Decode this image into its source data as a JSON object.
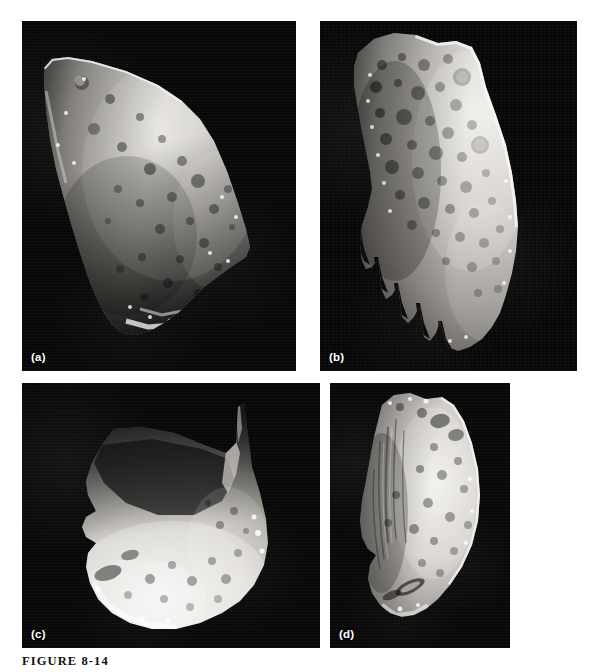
{
  "figure": {
    "caption": "FIGURE 8-14",
    "background_color": "#ffffff",
    "sky_color": "#070707",
    "label_color": "#ffffff"
  },
  "panels": [
    {
      "id": "panel-a",
      "label": "(a)",
      "subject": "cratered-elongated-asteroid",
      "x": 22,
      "y": 21,
      "width": 274,
      "height": 350
    },
    {
      "id": "panel-b",
      "label": "(b)",
      "subject": "heavily-cratered-vertical-asteroid",
      "x": 320,
      "y": 21,
      "width": 257,
      "height": 350
    },
    {
      "id": "panel-c",
      "label": "(c)",
      "subject": "large-crater-shadowed-asteroid",
      "x": 22,
      "y": 383,
      "width": 298,
      "height": 265
    },
    {
      "id": "panel-d",
      "label": "(d)",
      "subject": "grooved-crescent-asteroid",
      "x": 330,
      "y": 383,
      "width": 180,
      "height": 265
    }
  ]
}
